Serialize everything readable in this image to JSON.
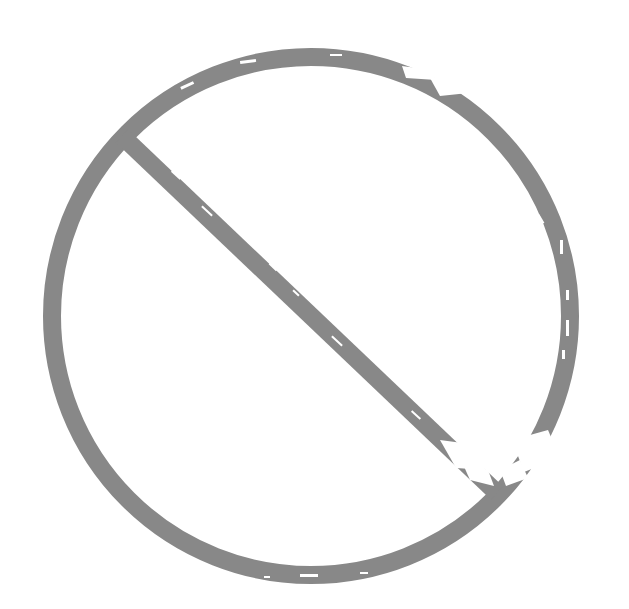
{
  "symbol": {
    "name": "prohibition-sign",
    "label": "",
    "style": "grunge",
    "colors": {
      "stroke": "#888888",
      "background": "#ffffff",
      "distress": "#ffffff"
    },
    "geometry": {
      "center_x": 311,
      "center_y": 316,
      "radius": 259,
      "ring_width": 18,
      "slash_width": 18,
      "slash_start": [
        122,
        136
      ],
      "slash_end": [
        497,
        493
      ]
    }
  }
}
